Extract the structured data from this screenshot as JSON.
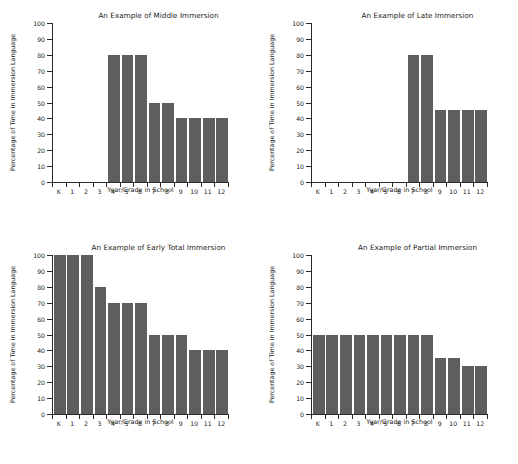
{
  "figure": {
    "background": "#ffffff",
    "bar_color": "#5e5e5e",
    "axis_color": "#2b2b2b",
    "panel_count": 4
  },
  "axes_common": {
    "xlabel": "Year/Grade in School",
    "ylabel": "Percentage of Time in Immersion Language",
    "ytick_labels": [
      "0",
      "10",
      "20",
      "30",
      "40",
      "50",
      "60",
      "70",
      "80",
      "90",
      "100"
    ],
    "xtick_labels": [
      "K",
      "1",
      "2",
      "3",
      "4",
      "5",
      "6",
      "7",
      "8",
      "9",
      "10",
      "11",
      "12"
    ]
  },
  "chart_data": [
    {
      "type": "bar",
      "title": "An Example of Middle Immersion",
      "xlabel": "Year/Grade in School",
      "ylabel": "Percentage of Time in Immersion Language",
      "categories": [
        "K",
        "1",
        "2",
        "3",
        "4",
        "5",
        "6",
        "7",
        "8",
        "9",
        "10",
        "11",
        "12"
      ],
      "values": [
        0,
        0,
        0,
        0,
        80,
        80,
        80,
        50,
        50,
        40,
        40,
        40,
        40
      ],
      "ylim": [
        0,
        100
      ],
      "grid": false,
      "legend": "none"
    },
    {
      "type": "bar",
      "title": "An Example of Late Immersion",
      "xlabel": "Year/Grade in School",
      "ylabel": "Percentage of Time in Immersion Language",
      "categories": [
        "K",
        "1",
        "2",
        "3",
        "4",
        "5",
        "6",
        "7",
        "8",
        "9",
        "10",
        "11",
        "12"
      ],
      "values": [
        0,
        0,
        0,
        0,
        0,
        0,
        0,
        80,
        80,
        45,
        45,
        45,
        45
      ],
      "ylim": [
        0,
        100
      ],
      "grid": false,
      "legend": "none"
    },
    {
      "type": "bar",
      "title": "An Example of Early Total Immersion",
      "xlabel": "Year/Grade in School",
      "ylabel": "Percentage of Time in Immersion Language",
      "categories": [
        "K",
        "1",
        "2",
        "3",
        "4",
        "5",
        "6",
        "7",
        "8",
        "9",
        "10",
        "11",
        "12"
      ],
      "values": [
        100,
        100,
        100,
        80,
        70,
        70,
        70,
        50,
        50,
        50,
        40,
        40,
        40
      ],
      "ylim": [
        0,
        100
      ],
      "grid": false,
      "legend": "none"
    },
    {
      "type": "bar",
      "title": "An Example of Partial Immersion",
      "xlabel": "Year/Grade in School",
      "ylabel": "Percentage of Time in Immersion Language",
      "categories": [
        "K",
        "1",
        "2",
        "3",
        "4",
        "5",
        "6",
        "7",
        "8",
        "9",
        "10",
        "11",
        "12"
      ],
      "values": [
        50,
        50,
        50,
        50,
        50,
        50,
        50,
        50,
        50,
        35,
        35,
        30,
        30
      ],
      "ylim": [
        0,
        100
      ],
      "grid": false,
      "legend": "none"
    }
  ]
}
